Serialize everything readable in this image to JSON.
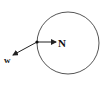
{
  "diagram": {
    "circle": {
      "cx": 68,
      "cy": 43,
      "r": 31,
      "stroke": "#555555"
    },
    "point": {
      "x": 37,
      "y": 42
    },
    "vectors": [
      {
        "id": "normal",
        "label": "N",
        "x2": 56,
        "y2": 42,
        "label_x": 58,
        "label_y": 47,
        "label_size": 11
      },
      {
        "id": "weight",
        "label": "w",
        "x2": 13,
        "y2": 55,
        "label_x": 4,
        "label_y": 63,
        "label_size": 9
      }
    ]
  }
}
